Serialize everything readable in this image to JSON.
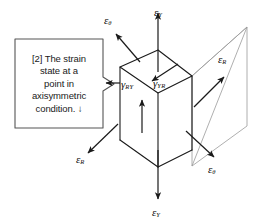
{
  "figure": {
    "title": "Strain state at a point in axisymmetric condition",
    "type": "engineering-diagram",
    "background": "#ffffff",
    "line_color": "#1a1a1a",
    "projection_line_color": "#9a9a9a"
  },
  "callout": {
    "lines": [
      "[2] The strain",
      "state at a",
      "point in",
      "axisymmetric",
      "condition.  ↓"
    ],
    "border_color": "#555555",
    "fill": "#ffffff"
  },
  "labels": {
    "epsilon_theta_top": {
      "base": "ε",
      "sub": "θ"
    },
    "epsilon_y_top": {
      "base": "ε",
      "sub": "Y"
    },
    "epsilon_r_right": {
      "base": "ε",
      "sub": "R"
    },
    "gamma_ry": {
      "base": "γ",
      "sub": "RY"
    },
    "gamma_yr": {
      "base": "γ",
      "sub": "YR"
    },
    "epsilon_r_left": {
      "base": "ε",
      "sub": "R"
    },
    "epsilon_theta_right": {
      "base": "ε",
      "sub": "θ"
    },
    "epsilon_y_bottom": {
      "base": "ε",
      "sub": "Y"
    }
  }
}
